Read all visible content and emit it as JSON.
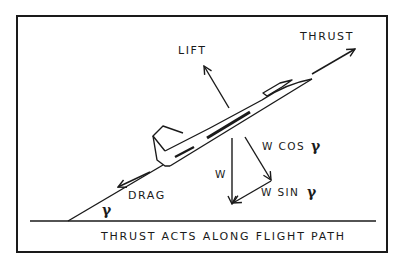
{
  "diagram": {
    "labels": {
      "thrust": "THRUST",
      "lift": "LIFT",
      "drag": "DRAG",
      "weight": "W",
      "w_cos": "W COS",
      "w_sin": "W SIN",
      "gamma": "γ"
    },
    "caption": "THRUST ACTS ALONG FLIGHT PATH",
    "colors": {
      "ink": "#1a1a1a",
      "background": "#ffffff"
    }
  }
}
